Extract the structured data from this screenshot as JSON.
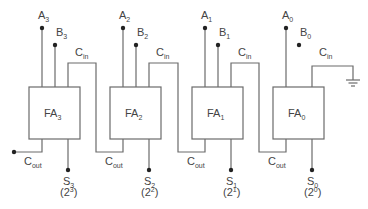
{
  "stages": [
    {
      "name": "FA",
      "sub": "3",
      "a": "A",
      "a_sub": "3",
      "b": "B",
      "b_sub": "3",
      "cin": "C",
      "cin_sub": "in",
      "cout": "C",
      "cout_sub": "out",
      "s": "S",
      "s_sub": "3",
      "weight": "(2",
      "weight_exp": "3",
      "weight_close": ")"
    },
    {
      "name": "FA",
      "sub": "2",
      "a": "A",
      "a_sub": "2",
      "b": "B",
      "b_sub": "2",
      "cin": "C",
      "cin_sub": "in",
      "cout": "C",
      "cout_sub": "out",
      "s": "S",
      "s_sub": "2",
      "weight": "(2",
      "weight_exp": "2",
      "weight_close": ")"
    },
    {
      "name": "FA",
      "sub": "1",
      "a": "A",
      "a_sub": "1",
      "b": "B",
      "b_sub": "1",
      "cin": "C",
      "cin_sub": "in",
      "cout": "C",
      "cout_sub": "out",
      "s": "S",
      "s_sub": "1",
      "weight": "(2",
      "weight_exp": "1",
      "weight_close": ")"
    },
    {
      "name": "FA",
      "sub": "0",
      "a": "A",
      "a_sub": "0",
      "b": "B",
      "b_sub": "0",
      "cin": "C",
      "cin_sub": "in",
      "cout": "C",
      "cout_sub": "out",
      "s": "S",
      "s_sub": "0",
      "weight": "(2",
      "weight_exp": "0",
      "weight_close": ")"
    }
  ],
  "ground_symbol": "ground-icon"
}
